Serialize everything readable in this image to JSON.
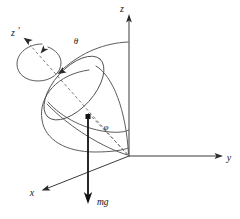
{
  "figure": {
    "kind": "physics-vector-diagram",
    "background_color": "#ffffff",
    "ink_color": "#3b3b3b",
    "width": 240,
    "height": 219
  },
  "axes": {
    "z": {
      "label": "z",
      "description": "vertical space-fixed axis, arrow pointing up",
      "origin": [
        129,
        156
      ],
      "tip": [
        129,
        17
      ]
    },
    "y": {
      "label": "y",
      "description": "horizontal space-fixed axis, arrow pointing right",
      "origin": [
        129,
        156
      ],
      "tip": [
        223,
        156
      ]
    },
    "x": {
      "label": "x",
      "description": "space-fixed axis, arrow pointing down-left toward viewer",
      "origin": [
        129,
        156
      ],
      "tip": [
        40,
        191
      ]
    },
    "z_prime": {
      "label": "z",
      "prime": "′",
      "description": "body-fixed symmetry axis of the top, arrow pointing up-left",
      "origin": [
        129,
        156
      ],
      "tip": [
        22,
        36
      ]
    }
  },
  "angles": {
    "theta": {
      "symbol": "θ",
      "description": "nutation angle between z axis and body axis z-prime, arc with arrowhead toward z-prime"
    },
    "phi": {
      "symbol": "φ",
      "description": "precession angle measured at the origin, marked by a dashed leader line"
    }
  },
  "vectors": {
    "weight": {
      "label": "mg",
      "description": "gravitational force vector drawn downward from the centre of mass of the top"
    },
    "spin": {
      "description": "circular arrow around the body axis z-prime indicating the spin of the top"
    }
  },
  "shapes": {
    "cone": "cone / top body whose apex sits at the origin and whose circular rim is drawn as an ellipse around the body axis",
    "precession_path": "looping curve traced by the tip of the body axis showing nutation during precession"
  }
}
